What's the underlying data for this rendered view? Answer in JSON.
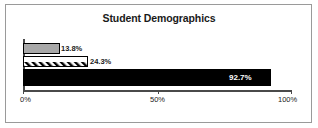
{
  "chart_data": {
    "type": "bar",
    "orientation": "horizontal",
    "title": "Student Demographics",
    "xlabel": "",
    "ylabel": "",
    "categories": [
      "",
      "",
      ""
    ],
    "values": [
      13.8,
      24.3,
      92.7
    ],
    "value_labels": [
      "13.8%",
      "24.3%",
      "92.7%"
    ],
    "series": [
      {
        "name": "",
        "values": [
          13.8,
          24.3,
          92.7
        ]
      }
    ],
    "bar_styles": [
      "solid-gray",
      "diagonal-hatch",
      "solid-black"
    ],
    "xlim": [
      0,
      100
    ],
    "xticks": [
      0,
      50,
      100
    ],
    "xtick_labels": [
      "0%",
      "50%",
      "100%"
    ],
    "grid": false,
    "legend": "none"
  },
  "colors": {
    "bar_gray": "#a8a8a8",
    "bar_black": "#000000",
    "hatch_line": "#000000",
    "axis": "#4a4a4a",
    "border": "#9a9a9a",
    "text": "#1a1a1a",
    "inverse_text": "#ffffff",
    "background": "#ffffff"
  }
}
